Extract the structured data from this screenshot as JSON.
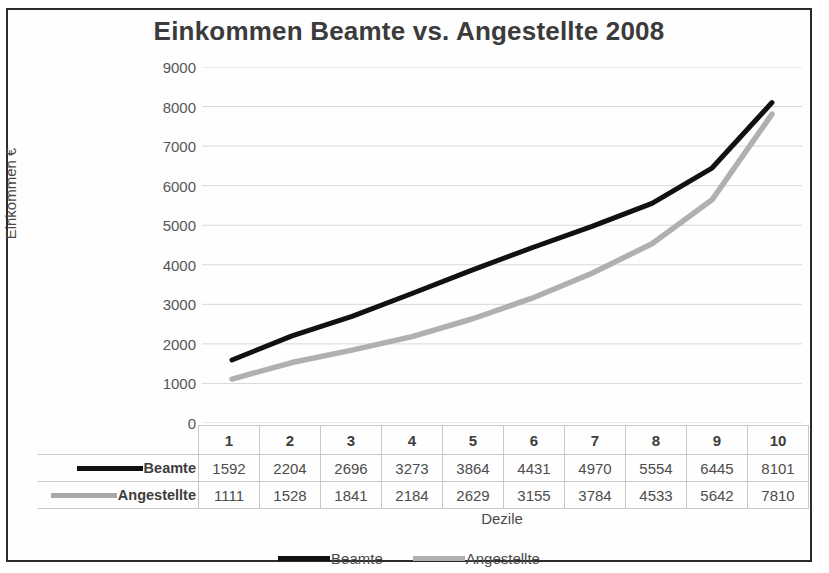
{
  "chart_data": {
    "type": "line",
    "title": "Einkommen Beamte vs. Angestellte 2008",
    "xlabel": "Dezile",
    "ylabel": "Einkommen €",
    "categories": [
      "1",
      "2",
      "3",
      "4",
      "5",
      "6",
      "7",
      "8",
      "9",
      "10"
    ],
    "series": [
      {
        "name": "Beamte",
        "color": "#111111",
        "values": [
          1592,
          2204,
          2696,
          3273,
          3864,
          4431,
          4970,
          5554,
          6445,
          8101
        ]
      },
      {
        "name": "Angestellte",
        "color": "#b0b0b0",
        "values": [
          1111,
          1528,
          1841,
          2184,
          2629,
          3155,
          3784,
          4533,
          5642,
          7810
        ]
      }
    ],
    "ylim": [
      0,
      9000
    ],
    "y_ticks": [
      "0",
      "1000",
      "2000",
      "3000",
      "4000",
      "5000",
      "6000",
      "7000",
      "8000",
      "9000"
    ],
    "grid": true,
    "legend_position": "bottom",
    "data_table_visible": true
  },
  "legend": {
    "entries": [
      {
        "label": "Beamte",
        "marker": "solid-black-line"
      },
      {
        "label": "Angestellte",
        "marker": "solid-gray-line"
      }
    ]
  },
  "table": {
    "row_labels": [
      "Beamte",
      "Angestellte"
    ]
  }
}
